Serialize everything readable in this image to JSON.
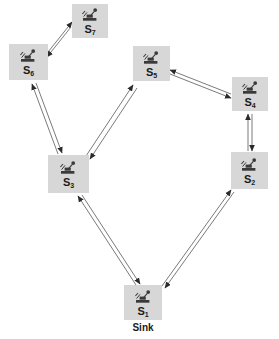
{
  "diagram": {
    "type": "network-topology",
    "colors": {
      "node_fill": "#d7d7d7",
      "edge": "#4d4d4d",
      "text": "#1b1b1b",
      "background": "#ffffff"
    },
    "nodes": [
      {
        "id": "s7",
        "label": "S",
        "subscript": "7",
        "icon": "sensor-mote-icon",
        "x": 72,
        "y": 4,
        "w": 36,
        "h": 34
      },
      {
        "id": "s6",
        "label": "S",
        "subscript": "6",
        "icon": "sensor-mote-icon",
        "x": 9,
        "y": 44,
        "w": 39,
        "h": 36
      },
      {
        "id": "s5",
        "label": "S",
        "subscript": "5",
        "icon": "sensor-mote-icon",
        "x": 133,
        "y": 46,
        "w": 37,
        "h": 35
      },
      {
        "id": "s4",
        "label": "S",
        "subscript": "4",
        "icon": "sensor-mote-icon",
        "x": 232,
        "y": 77,
        "w": 36,
        "h": 34
      },
      {
        "id": "s3",
        "label": "S",
        "subscript": "3",
        "icon": "sensor-mote-icon",
        "x": 48,
        "y": 155,
        "w": 41,
        "h": 38
      },
      {
        "id": "s2",
        "label": "S",
        "subscript": "2",
        "icon": "sensor-mote-icon",
        "x": 231,
        "y": 152,
        "w": 37,
        "h": 37
      },
      {
        "id": "s1",
        "label": "S",
        "subscript": "1",
        "icon": "sensor-mote-icon",
        "x": 124,
        "y": 285,
        "w": 38,
        "h": 35
      }
    ],
    "captions": [
      {
        "id": "sink-caption",
        "text": "Sink",
        "x": 111,
        "y": 322,
        "w": 64
      }
    ],
    "links": [
      {
        "id": "s7-s6",
        "from": "s7",
        "to": "s6",
        "bidirectional": true
      },
      {
        "id": "s6-s3",
        "from": "s6",
        "to": "s3",
        "bidirectional": true
      },
      {
        "id": "s5-s3",
        "from": "s5",
        "to": "s3",
        "bidirectional": true
      },
      {
        "id": "s5-s4",
        "from": "s5",
        "to": "s4",
        "bidirectional": true
      },
      {
        "id": "s4-s2",
        "from": "s4",
        "to": "s2",
        "bidirectional": true
      },
      {
        "id": "s3-s1",
        "from": "s3",
        "to": "s1",
        "bidirectional": true
      },
      {
        "id": "s2-s1",
        "from": "s2",
        "to": "s1",
        "bidirectional": true
      }
    ]
  }
}
